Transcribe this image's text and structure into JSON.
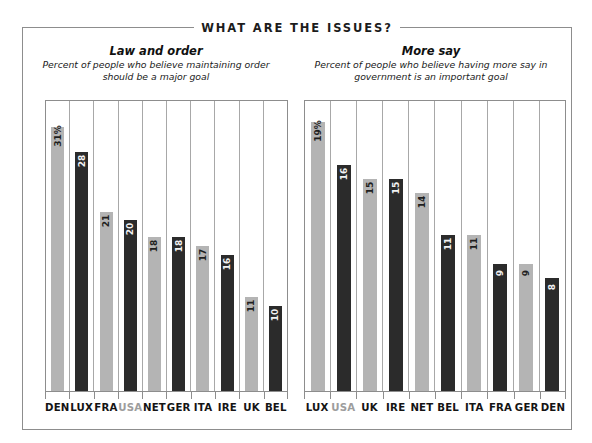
{
  "banner": {
    "title": "WHAT ARE THE ISSUES?"
  },
  "panels": [
    {
      "title": "Law and order",
      "subtitle": "Percent of people who believe maintaining order should be a major goal"
    },
    {
      "title": "More say",
      "subtitle": "Percent of people who believe having more say in government is an important goal"
    }
  ],
  "colors": {
    "light_bar": "#b4b4b4",
    "dark_bar": "#2b2b2b",
    "frame": "#8d8d8d",
    "highlight_label": "#9d9d9d",
    "text": "#141414"
  },
  "chart_data": [
    {
      "type": "bar",
      "title": "Law and order",
      "subtitle": "Percent of people who believe maintaining order should be a major goal",
      "xlabel": "",
      "ylabel": "",
      "ylim": [
        0,
        34
      ],
      "grid": true,
      "legend": "none",
      "categories": [
        "DEN",
        "LUX",
        "FRA",
        "USA",
        "NET",
        "GER",
        "ITA",
        "IRE",
        "UK",
        "BEL"
      ],
      "values": [
        31,
        28,
        21,
        20,
        18,
        18,
        17,
        16,
        11,
        10
      ],
      "labels": [
        "31%",
        "28",
        "21",
        "20",
        "18",
        "18",
        "17",
        "16",
        "11",
        "10"
      ],
      "bar_shades": [
        "light",
        "dark",
        "light",
        "dark",
        "light",
        "dark",
        "light",
        "dark",
        "light",
        "dark"
      ],
      "highlighted_category": "USA"
    },
    {
      "type": "bar",
      "title": "More say",
      "subtitle": "Percent of people who believe having more say in government is an important goal",
      "xlabel": "",
      "ylabel": "",
      "ylim": [
        0,
        20.5
      ],
      "grid": true,
      "legend": "none",
      "categories": [
        "LUX",
        "USA",
        "UK",
        "IRE",
        "NET",
        "BEL",
        "ITA",
        "FRA",
        "GER",
        "DEN"
      ],
      "values": [
        19,
        16,
        15,
        15,
        14,
        11,
        11,
        9,
        9,
        8
      ],
      "labels": [
        "19%",
        "16",
        "15",
        "15",
        "14",
        "11",
        "11",
        "9",
        "9",
        "8"
      ],
      "bar_shades": [
        "light",
        "dark",
        "light",
        "dark",
        "light",
        "dark",
        "light",
        "dark",
        "light",
        "dark"
      ],
      "highlighted_category": "USA"
    }
  ]
}
